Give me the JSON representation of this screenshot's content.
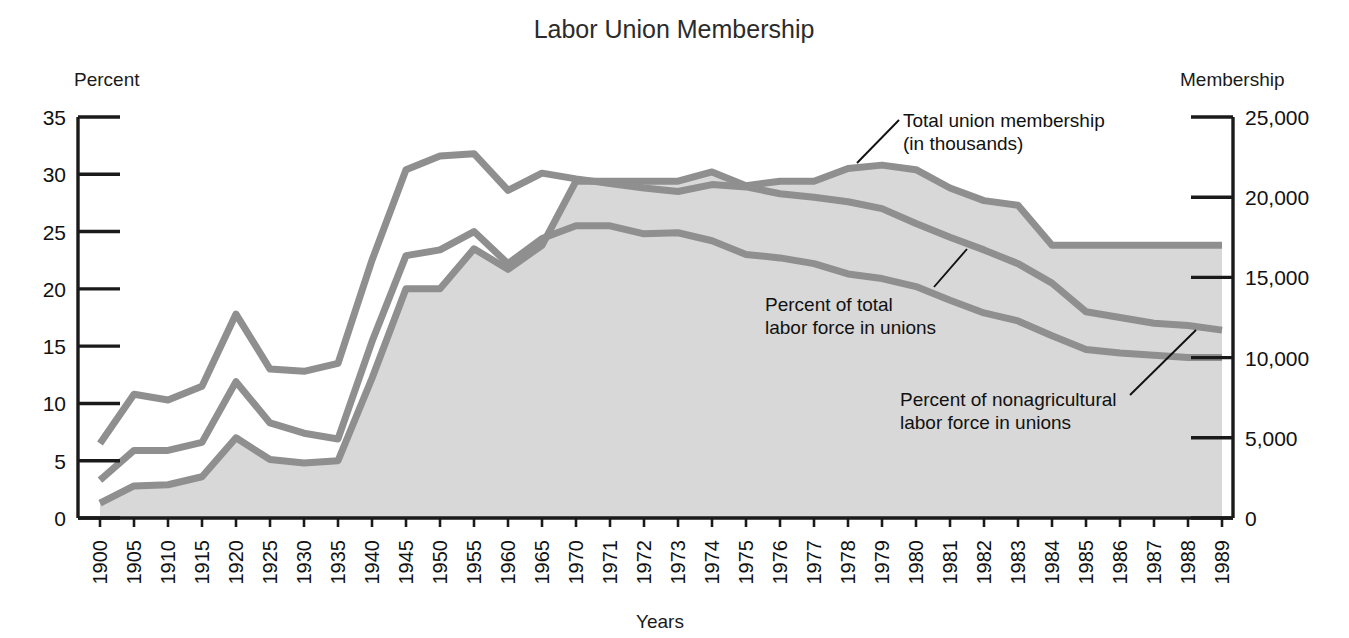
{
  "chart": {
    "title": "Labor Union Membership",
    "left_axis_label": "Percent",
    "right_axis_label": "Membership",
    "x_axis_label": "Years"
  },
  "annotations": {
    "total": {
      "line1": "Total union membership",
      "line2": "(in thousands)"
    },
    "pct_total": {
      "line1": "Percent of total",
      "line2": "labor force in unions"
    },
    "pct_nonag": {
      "line1": "Percent of nonagricultural",
      "line2": "labor force in unions"
    }
  },
  "colors": {
    "area_fill": "#d8d8d8",
    "line_stroke": "#8f8f8f",
    "axis": "#1a1a1a",
    "text": "#111111",
    "title": "#2b2b2b"
  },
  "chart_data": {
    "type": "area",
    "title": "Labor Union Membership",
    "xlabel": "Years",
    "ylabel": "Percent",
    "y2label": "Membership",
    "ylim": [
      0,
      35
    ],
    "y2lim": [
      0,
      25000
    ],
    "yticks": [
      0,
      5,
      10,
      15,
      20,
      25,
      30,
      35
    ],
    "ytick_labels": [
      "0",
      "5",
      "10",
      "15",
      "20",
      "25",
      "30",
      "35"
    ],
    "y2ticks": [
      0,
      5000,
      10000,
      15000,
      20000,
      25000
    ],
    "y2tick_labels": [
      "0",
      "5,000",
      "10,000",
      "15,000",
      "20,000",
      "25,000"
    ],
    "grid": false,
    "legend": "annotations",
    "categories": [
      "1900",
      "1905",
      "1910",
      "1915",
      "1920",
      "1925",
      "1930",
      "1935",
      "1940",
      "1945",
      "1950",
      "1955",
      "1960",
      "1965",
      "1970",
      "1971",
      "1972",
      "1973",
      "1974",
      "1975",
      "1976",
      "1977",
      "1978",
      "1979",
      "1980",
      "1981",
      "1982",
      "1983",
      "1984",
      "1985",
      "1986",
      "1987",
      "1988",
      "1989"
    ],
    "series": [
      {
        "name": "Total union membership (in thousands)",
        "axis": "right",
        "units": "thousands",
        "filled": true,
        "values": [
          900,
          2000,
          2100,
          2600,
          5000,
          3600,
          3400,
          3600,
          8700,
          14300,
          14300,
          16800,
          15500,
          17000,
          21000,
          21000,
          21000,
          21000,
          21600,
          20700,
          21000,
          21000,
          21800,
          22000,
          21700,
          20600,
          19800,
          19500,
          17000,
          17000,
          17000,
          17000,
          17000,
          17000
        ],
        "percent_scale_equivalent": [
          1.3,
          2.8,
          2.9,
          3.6,
          7.0,
          5.1,
          4.8,
          5.0,
          12.2,
          20.0,
          20.0,
          23.5,
          21.7,
          23.8,
          29.4,
          29.4,
          29.4,
          29.4,
          30.2,
          29.0,
          29.4,
          29.4,
          30.5,
          30.8,
          30.4,
          28.8,
          27.7,
          27.3,
          23.8,
          23.8,
          23.8,
          23.8,
          23.8,
          23.8
        ]
      },
      {
        "name": "Percent of total labor force in unions",
        "axis": "left",
        "units": "percent",
        "filled": false,
        "values": [
          3.3,
          5.9,
          5.9,
          6.6,
          11.9,
          8.3,
          7.4,
          6.9,
          15.4,
          22.9,
          23.4,
          25.0,
          22.2,
          24.4,
          25.5,
          25.5,
          24.8,
          24.9,
          24.2,
          23.0,
          22.7,
          22.2,
          21.3,
          20.9,
          20.2,
          19.0,
          17.9,
          17.2,
          15.9,
          14.7,
          14.4,
          14.2,
          14.0,
          14.0
        ]
      },
      {
        "name": "Percent of nonagricultural labor force in unions",
        "axis": "left",
        "units": "percent",
        "filled": false,
        "values": [
          6.5,
          10.8,
          10.3,
          11.5,
          17.8,
          13.0,
          12.8,
          13.5,
          22.5,
          30.4,
          31.6,
          31.8,
          28.6,
          30.1,
          29.6,
          29.2,
          28.8,
          28.5,
          29.1,
          28.9,
          28.3,
          28.0,
          27.6,
          27.0,
          25.7,
          24.5,
          23.4,
          22.2,
          20.5,
          18.0,
          17.5,
          17.0,
          16.8,
          16.4
        ]
      }
    ]
  }
}
